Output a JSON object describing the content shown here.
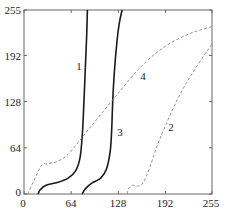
{
  "chart_data": {
    "type": "line",
    "title": "",
    "xlabel": "",
    "ylabel": "",
    "xlim": [
      0,
      255
    ],
    "ylim": [
      0,
      255
    ],
    "grid": false,
    "legend": "none (curves labeled inline 1–4)",
    "x_ticks": [
      0,
      64,
      128,
      192,
      255
    ],
    "y_ticks": [
      0,
      64,
      128,
      192,
      255
    ],
    "series": [
      {
        "name": "1",
        "style": "solid",
        "points": [
          [
            19,
            0
          ],
          [
            22,
            6
          ],
          [
            30,
            12
          ],
          [
            45,
            16
          ],
          [
            60,
            22
          ],
          [
            70,
            32
          ],
          [
            76,
            50
          ],
          [
            79,
            80
          ],
          [
            81,
            120
          ],
          [
            83,
            170
          ],
          [
            85,
            220
          ],
          [
            86,
            255
          ]
        ]
      },
      {
        "name": "3",
        "style": "solid",
        "points": [
          [
            79,
            0
          ],
          [
            83,
            7
          ],
          [
            92,
            15
          ],
          [
            104,
            22
          ],
          [
            112,
            35
          ],
          [
            117,
            60
          ],
          [
            119,
            90
          ],
          [
            120,
            120
          ],
          [
            122,
            160
          ],
          [
            125,
            200
          ],
          [
            129,
            235
          ],
          [
            133,
            255
          ]
        ]
      },
      {
        "name": "4",
        "style": "dashed",
        "points": [
          [
            5,
            0
          ],
          [
            15,
            22
          ],
          [
            24,
            40
          ],
          [
            32,
            42
          ],
          [
            45,
            45
          ],
          [
            60,
            55
          ],
          [
            80,
            80
          ],
          [
            100,
            105
          ],
          [
            128,
            140
          ],
          [
            160,
            178
          ],
          [
            192,
            205
          ],
          [
            224,
            222
          ],
          [
            255,
            232
          ]
        ]
      },
      {
        "name": "2",
        "style": "dashed",
        "points": [
          [
            140,
            0
          ],
          [
            142,
            8
          ],
          [
            147,
            12
          ],
          [
            155,
            11
          ],
          [
            162,
            16
          ],
          [
            170,
            35
          ],
          [
            180,
            65
          ],
          [
            192,
            95
          ],
          [
            210,
            135
          ],
          [
            230,
            170
          ],
          [
            255,
            208
          ]
        ]
      }
    ],
    "annotations": [
      {
        "text": "1",
        "x": 75,
        "y": 177
      },
      {
        "text": "3",
        "x": 131,
        "y": 85
      },
      {
        "text": "4",
        "x": 162,
        "y": 160
      },
      {
        "text": "2",
        "x": 199,
        "y": 93
      }
    ]
  },
  "labels": {
    "x_ticks": [
      "0",
      "64",
      "128",
      "192",
      "255"
    ],
    "y_ticks": [
      "0",
      "64",
      "128",
      "192",
      "255"
    ],
    "curves": [
      "1",
      "3",
      "4",
      "2"
    ]
  }
}
